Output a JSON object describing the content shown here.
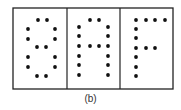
{
  "figure": {
    "caption": "(b)",
    "frame": {
      "x": 13,
      "y": 8,
      "width": 160,
      "height": 81,
      "stroke": "#222222"
    },
    "dividers_x": [
      67,
      120
    ],
    "dot_color": "#111111",
    "dot_radius": 1.9,
    "panels": [
      {
        "char": "8",
        "dots": [
          [
            38,
            20
          ],
          [
            47,
            20
          ],
          [
            28,
            29
          ],
          [
            55,
            29
          ],
          [
            28,
            39
          ],
          [
            55,
            39
          ],
          [
            37,
            47
          ],
          [
            46,
            47
          ],
          [
            28,
            57
          ],
          [
            55,
            57
          ],
          [
            28,
            67
          ],
          [
            55,
            67
          ],
          [
            37,
            76
          ],
          [
            46,
            76
          ]
        ]
      },
      {
        "char": "A",
        "dots": [
          [
            90,
            20
          ],
          [
            99,
            20
          ],
          [
            79,
            27
          ],
          [
            108,
            27
          ],
          [
            79,
            36
          ],
          [
            108,
            36
          ],
          [
            79,
            46
          ],
          [
            90,
            46
          ],
          [
            99,
            46
          ],
          [
            108,
            46
          ],
          [
            79,
            56
          ],
          [
            108,
            56
          ],
          [
            79,
            65
          ],
          [
            108,
            65
          ],
          [
            79,
            75
          ],
          [
            108,
            75
          ]
        ]
      },
      {
        "char": "F",
        "dots": [
          [
            136,
            20
          ],
          [
            146,
            20
          ],
          [
            155,
            20
          ],
          [
            165,
            20
          ],
          [
            136,
            29
          ],
          [
            136,
            38
          ],
          [
            136,
            48
          ],
          [
            146,
            48
          ],
          [
            155,
            48
          ],
          [
            136,
            57
          ],
          [
            136,
            67
          ],
          [
            136,
            76
          ]
        ]
      }
    ]
  }
}
